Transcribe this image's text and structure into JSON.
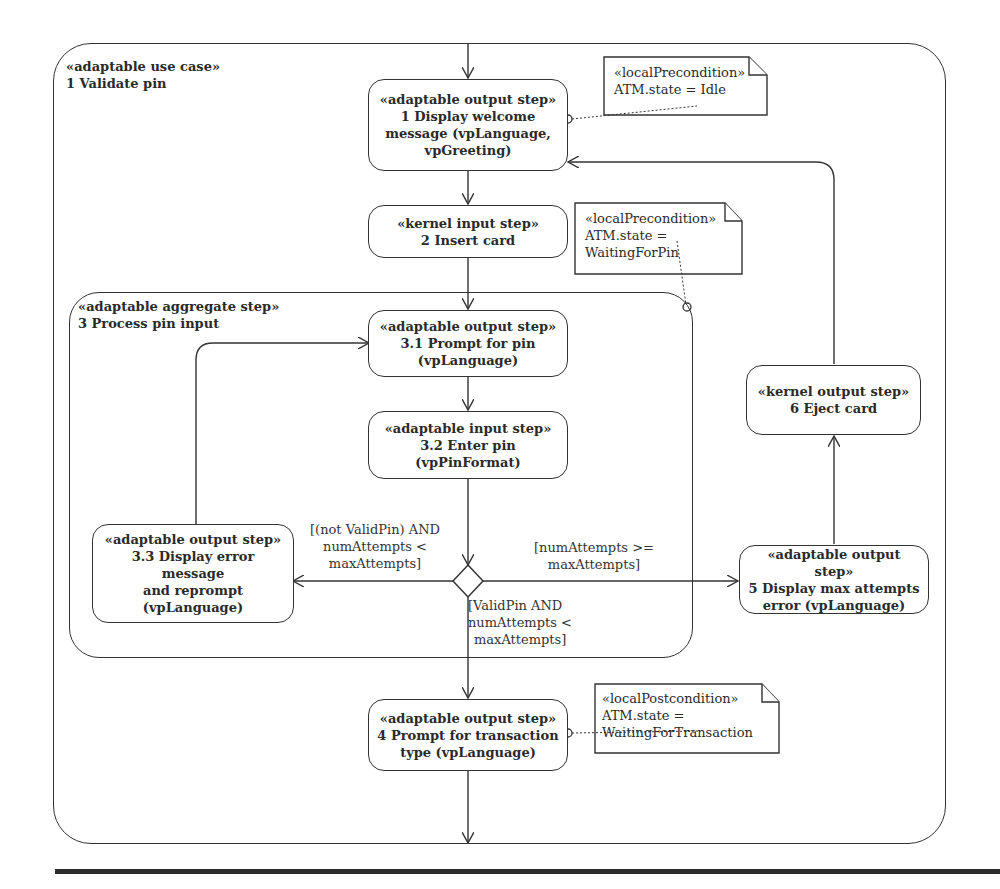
{
  "use_case": {
    "stereotype": "«adaptable use case»",
    "title": "1 Validate pin"
  },
  "aggregate": {
    "stereotype": "«adaptable aggregate step»",
    "title": "3 Process pin input"
  },
  "steps": {
    "s1": {
      "stereotype": "«adaptable output step»",
      "lines": [
        "1 Display welcome",
        "message (vpLanguage,",
        "vpGreeting)"
      ]
    },
    "s2": {
      "stereotype": "«kernel input step»",
      "lines": [
        "2 Insert card"
      ]
    },
    "s31": {
      "stereotype": "«adaptable output step»",
      "lines": [
        "3.1 Prompt for pin",
        "(vpLanguage)"
      ]
    },
    "s32": {
      "stereotype": "«adaptable input step»",
      "lines": [
        "3.2 Enter pin",
        "(vpPinFormat)"
      ]
    },
    "s33": {
      "stereotype": "«adaptable output step»",
      "lines": [
        "3.3 Display error message",
        "and reprompt",
        "(vpLanguage)"
      ]
    },
    "s4": {
      "stereotype": "«adaptable output step»",
      "lines": [
        "4 Prompt for transaction",
        "type (vpLanguage)"
      ]
    },
    "s5": {
      "stereotype": "«adaptable output step»",
      "lines": [
        "5 Display max attempts",
        "error (vpLanguage)"
      ]
    },
    "s6": {
      "stereotype": "«kernel output step»",
      "lines": [
        "6 Eject card"
      ]
    }
  },
  "notes": {
    "n1": {
      "stereotype": "«localPrecondition»",
      "lines": [
        "ATM.state = Idle"
      ]
    },
    "n2": {
      "stereotype": "«localPrecondition»",
      "lines": [
        "ATM.state =",
        "WaitingForPin"
      ]
    },
    "n3": {
      "stereotype": "«localPostcondition»",
      "lines": [
        "ATM.state =",
        "WaitingForTransaction"
      ]
    }
  },
  "guards": {
    "retry": [
      "[(not ValidPin) AND",
      "numAttempts <",
      "maxAttempts]"
    ],
    "max": [
      "[numAttempts >=",
      "maxAttempts]"
    ],
    "valid": [
      "[ValidPin AND",
      "numAttempts <",
      "maxAttempts]"
    ]
  }
}
